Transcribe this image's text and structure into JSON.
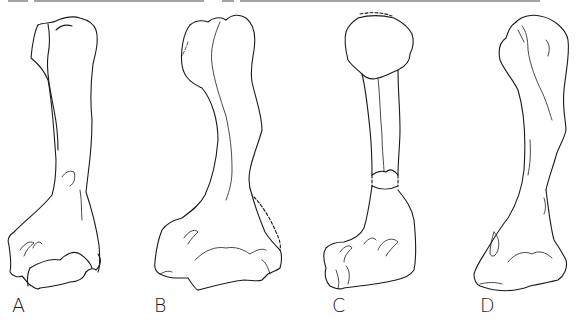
{
  "figure": {
    "panels": [
      {
        "id": "A",
        "label": "A"
      },
      {
        "id": "B",
        "label": "B"
      },
      {
        "id": "C",
        "label": "C"
      },
      {
        "id": "D",
        "label": "D"
      }
    ],
    "colors": {
      "stroke": "#1a1a1a",
      "background": "#ffffff"
    }
  }
}
